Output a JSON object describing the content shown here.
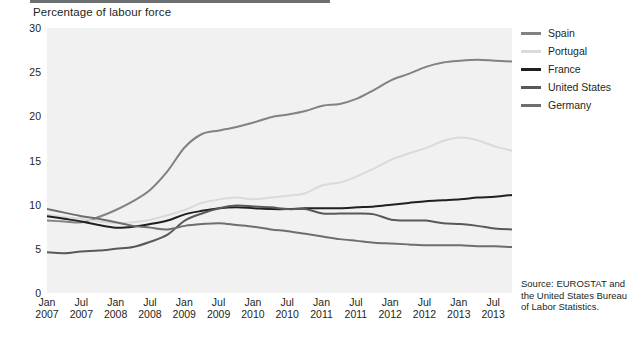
{
  "chart_title": "Percentage of labour force",
  "source": {
    "line1": "Source:  EUROSTAT and",
    "line2": "the United States Bureau",
    "line3": "of Labor Statistics."
  },
  "legend": [
    {
      "label": "Spain",
      "color": "#808285"
    },
    {
      "label": "Portugal",
      "color": "#d9dada"
    },
    {
      "label": "France",
      "color": "#231f20"
    },
    {
      "label": "United States",
      "color": "#58595b"
    },
    {
      "label": "Germany",
      "color": "#6d6e71"
    }
  ],
  "chart_data": {
    "type": "line",
    "title": "Percentage of labour force",
    "xlabel": "",
    "ylabel": "Percentage of labour force",
    "ylim": [
      0,
      30
    ],
    "yticks": [
      0,
      5,
      10,
      15,
      20,
      25,
      30
    ],
    "grid": false,
    "legend_position": "right",
    "xtick_labels": [
      {
        "month": "Jan",
        "year": "2007"
      },
      {
        "month": "Jul",
        "year": "2007"
      },
      {
        "month": "Jan",
        "year": "2008"
      },
      {
        "month": "Jul",
        "year": "2008"
      },
      {
        "month": "Jan",
        "year": "2009"
      },
      {
        "month": "Jul",
        "year": "2009"
      },
      {
        "month": "Jan",
        "year": "2010"
      },
      {
        "month": "Jul",
        "year": "2010"
      },
      {
        "month": "Jan",
        "year": "2011"
      },
      {
        "month": "Jul",
        "year": "2011"
      },
      {
        "month": "Jan",
        "year": "2012"
      },
      {
        "month": "Jul",
        "year": "2012"
      },
      {
        "month": "Jan",
        "year": "2013"
      },
      {
        "month": "Jul",
        "year": "2013"
      }
    ],
    "x": [
      "2007-01",
      "2007-04",
      "2007-07",
      "2007-10",
      "2008-01",
      "2008-04",
      "2008-07",
      "2008-10",
      "2009-01",
      "2009-04",
      "2009-07",
      "2009-10",
      "2010-01",
      "2010-04",
      "2010-07",
      "2010-10",
      "2011-01",
      "2011-04",
      "2011-07",
      "2011-10",
      "2012-01",
      "2012-04",
      "2012-07",
      "2012-10",
      "2013-01",
      "2013-04",
      "2013-07",
      "2013-10"
    ],
    "series": [
      {
        "name": "Spain",
        "color": "#808285",
        "values": [
          8.2,
          8.1,
          8.0,
          8.6,
          9.4,
          10.4,
          11.7,
          13.8,
          16.5,
          18.0,
          18.4,
          18.8,
          19.3,
          19.9,
          20.2,
          20.6,
          21.2,
          21.4,
          22.0,
          23.0,
          24.1,
          24.8,
          25.6,
          26.1,
          26.3,
          26.4,
          26.3,
          26.2
        ]
      },
      {
        "name": "Portugal",
        "color": "#d9dada",
        "values": [
          8.9,
          8.6,
          8.4,
          8.1,
          7.9,
          8.0,
          8.3,
          8.8,
          9.4,
          10.2,
          10.6,
          10.8,
          10.6,
          10.8,
          11.0,
          11.3,
          12.2,
          12.5,
          13.2,
          14.1,
          15.1,
          15.8,
          16.4,
          17.2,
          17.6,
          17.3,
          16.6,
          16.1
        ]
      },
      {
        "name": "France",
        "color": "#231f20",
        "values": [
          8.7,
          8.4,
          8.1,
          7.7,
          7.4,
          7.5,
          7.8,
          8.2,
          8.9,
          9.3,
          9.6,
          9.7,
          9.6,
          9.5,
          9.5,
          9.6,
          9.6,
          9.6,
          9.7,
          9.8,
          10.0,
          10.2,
          10.4,
          10.5,
          10.6,
          10.8,
          10.9,
          11.1
        ]
      },
      {
        "name": "United States",
        "color": "#58595b",
        "values": [
          4.6,
          4.5,
          4.7,
          4.8,
          5.0,
          5.2,
          5.8,
          6.6,
          8.2,
          9.0,
          9.6,
          9.9,
          9.8,
          9.7,
          9.5,
          9.5,
          9.0,
          9.0,
          9.0,
          8.9,
          8.3,
          8.2,
          8.2,
          7.9,
          7.8,
          7.6,
          7.3,
          7.2
        ]
      },
      {
        "name": "Germany",
        "color": "#6d6e71",
        "values": [
          9.5,
          9.1,
          8.7,
          8.4,
          8.0,
          7.6,
          7.4,
          7.2,
          7.6,
          7.8,
          7.9,
          7.7,
          7.5,
          7.2,
          7.0,
          6.7,
          6.4,
          6.1,
          5.9,
          5.7,
          5.6,
          5.5,
          5.4,
          5.4,
          5.4,
          5.3,
          5.3,
          5.2
        ]
      }
    ]
  }
}
